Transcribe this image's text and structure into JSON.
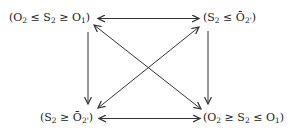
{
  "diagram": {
    "nodes": {
      "top_left": {
        "open": "(",
        "a": "O",
        "a_sub": "2",
        "op1": " ≤ ",
        "b": "S",
        "b_sub": "2",
        "op2": " ≥ ",
        "c": "O",
        "c_sub": "1",
        "close": ")"
      },
      "top_right": {
        "open": "(",
        "a": "S",
        "a_sub": "2",
        "op1": " ≤ ",
        "b": "Ō",
        "b_sub": "2'",
        "close": ")"
      },
      "bottom_left": {
        "open": "(",
        "a": "S",
        "a_sub": "2",
        "op1": " ≥ ",
        "b": "Ō",
        "b_sub": "2'",
        "close": ")"
      },
      "bottom_right": {
        "open": "(",
        "a": "O",
        "a_sub": "2",
        "op1": " ≥ ",
        "b": "S",
        "b_sub": "2",
        "op2": " ≤ ",
        "c": "O",
        "c_sub": "1",
        "close": ")"
      }
    },
    "edges": [
      {
        "from": "top_left",
        "to": "top_right",
        "type": "double-headed"
      },
      {
        "from": "bottom_left",
        "to": "bottom_right",
        "type": "double-headed"
      },
      {
        "from": "top_left",
        "to": "bottom_left",
        "type": "single-headed"
      },
      {
        "from": "top_right",
        "to": "bottom_right",
        "type": "single-headed"
      },
      {
        "from": "top_left",
        "to": "bottom_right",
        "type": "double-headed"
      },
      {
        "from": "top_right",
        "to": "bottom_left",
        "type": "double-headed"
      }
    ],
    "stroke_color": "#333333"
  }
}
